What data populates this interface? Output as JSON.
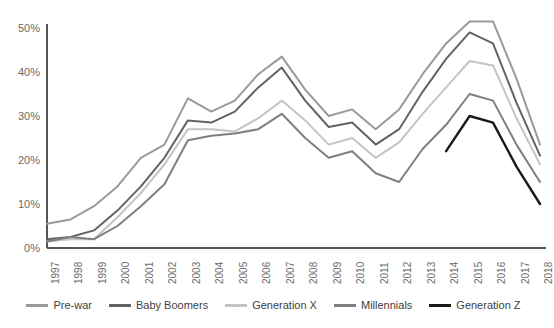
{
  "chart_data": {
    "type": "line",
    "title": "",
    "subtitle": "",
    "xlabel": "",
    "ylabel": "",
    "grid": false,
    "legend_position": "bottom",
    "x": [
      1997,
      1998,
      1999,
      2000,
      2001,
      2002,
      2003,
      2004,
      2005,
      2006,
      2007,
      2008,
      2009,
      2010,
      2011,
      2012,
      2013,
      2014,
      2015,
      2016,
      2017,
      2018
    ],
    "xtick_labels": [
      "1997",
      "1998",
      "1999",
      "2000",
      "2001",
      "2002",
      "2003",
      "2004",
      "2005",
      "2006",
      "2007",
      "2008",
      "2009",
      "2010",
      "2011",
      "2012",
      "2013",
      "2014",
      "2015",
      "2016",
      "2017",
      "2018"
    ],
    "ytick_labels": [
      "0%",
      "10%",
      "20%",
      "30%",
      "40%",
      "50%"
    ],
    "yticks": [
      0,
      10,
      20,
      30,
      40,
      50
    ],
    "ylim": [
      0,
      55
    ],
    "xlim": [
      1997,
      2018
    ],
    "series": [
      {
        "name": "Pre-war",
        "color": "#9a9a9a",
        "values": [
          5.5,
          6.5,
          9.5,
          14.0,
          20.5,
          23.5,
          34.0,
          31.0,
          33.5,
          39.5,
          43.5,
          36.0,
          30.0,
          31.5,
          27.0,
          31.5,
          39.5,
          46.5,
          51.5,
          51.5,
          38.5,
          23.5
        ]
      },
      {
        "name": "Baby Boomers",
        "color": "#636363",
        "values": [
          2.0,
          2.5,
          4.0,
          8.5,
          14.0,
          20.5,
          29.0,
          28.5,
          31.0,
          36.5,
          41.0,
          33.5,
          27.5,
          28.5,
          23.5,
          27.0,
          35.5,
          43.0,
          49.0,
          46.5,
          33.0,
          21.0
        ]
      },
      {
        "name": "Generation X",
        "color": "#c4c4c4",
        "values": [
          1.5,
          2.0,
          2.0,
          7.0,
          12.5,
          19.0,
          27.0,
          27.0,
          26.5,
          29.5,
          33.5,
          29.0,
          23.5,
          25.0,
          20.5,
          24.0,
          30.5,
          36.5,
          42.5,
          41.5,
          29.5,
          19.0
        ]
      },
      {
        "name": "Millennials",
        "color": "#7f7f7f",
        "values": [
          1.5,
          2.5,
          2.0,
          5.0,
          9.5,
          14.5,
          24.5,
          25.5,
          26.0,
          27.0,
          30.5,
          25.0,
          20.5,
          22.0,
          17.0,
          15.0,
          22.5,
          28.0,
          35.0,
          33.5,
          23.5,
          15.0
        ]
      },
      {
        "name": "Generation Z",
        "color": "#1a1a1a",
        "start_index": 17,
        "values": [
          null,
          null,
          null,
          null,
          null,
          null,
          null,
          null,
          null,
          null,
          null,
          null,
          null,
          null,
          null,
          null,
          null,
          22.0,
          30.0,
          28.5,
          18.5,
          10.0
        ]
      }
    ]
  },
  "axis": {
    "y_axis_color": "#555555",
    "x_axis_color": "#555555"
  }
}
